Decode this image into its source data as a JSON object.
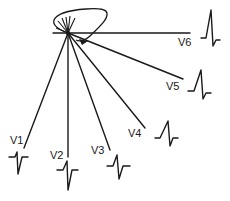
{
  "diagram": {
    "colors": {
      "ink": "#1a1a1a",
      "background": "#ffffff"
    },
    "origin": {
      "x": 68,
      "y": 33
    },
    "leads": [
      {
        "id": "V1",
        "label": "V1",
        "complex": "rS"
      },
      {
        "id": "V2",
        "label": "V2",
        "complex": "rS"
      },
      {
        "id": "V3",
        "label": "V3",
        "complex": "RS"
      },
      {
        "id": "V4",
        "label": "V4",
        "complex": "Rs"
      },
      {
        "id": "V5",
        "label": "V5",
        "complex": "qR"
      },
      {
        "id": "V6",
        "label": "V6",
        "complex": "qR"
      }
    ]
  }
}
